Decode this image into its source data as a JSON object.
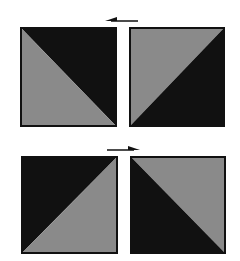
{
  "figure": {
    "colors": {
      "dark": "#111111",
      "light": "#8a8a8a",
      "background": "#ffffff"
    },
    "rows": [
      {
        "arrow": {
          "direction": "left",
          "icon": "arrow-left-icon"
        },
        "tiles": [
          {
            "diagonal": "top-left-to-bottom-right",
            "dark_half": "upper-right",
            "light_half": "lower-left"
          },
          {
            "diagonal": "bottom-left-to-top-right",
            "dark_half": "lower-right",
            "light_half": "upper-left"
          }
        ]
      },
      {
        "arrow": {
          "direction": "right",
          "icon": "arrow-right-icon"
        },
        "tiles": [
          {
            "diagonal": "bottom-left-to-top-right",
            "dark_half": "upper-left",
            "light_half": "lower-right"
          },
          {
            "diagonal": "top-left-to-bottom-right",
            "dark_half": "lower-left",
            "light_half": "upper-right"
          }
        ]
      }
    ]
  }
}
